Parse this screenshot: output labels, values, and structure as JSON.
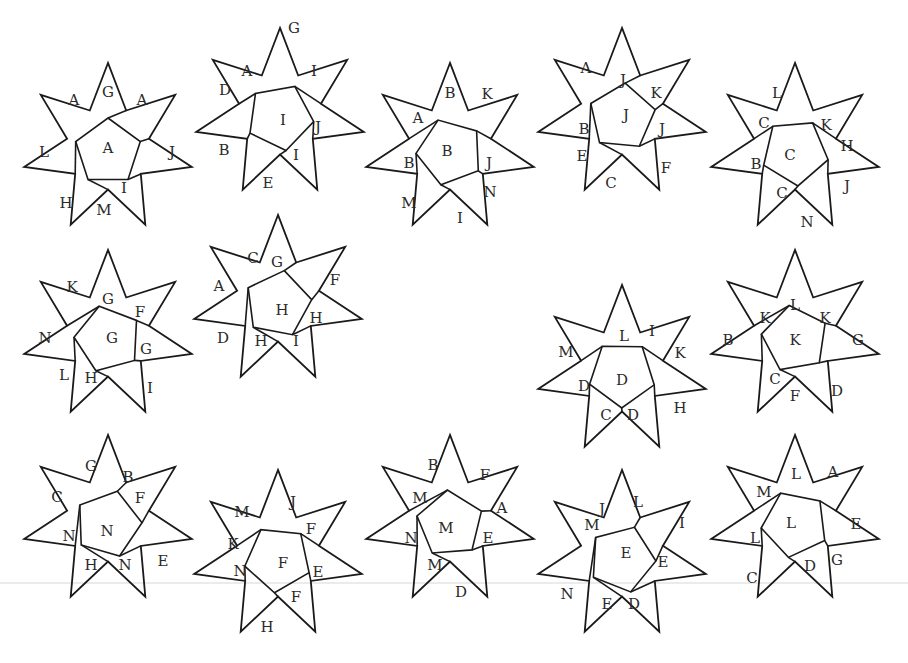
{
  "figure": {
    "stroke_color": "#1a1a1a",
    "label_color": "#2a2a2a",
    "faint_line_color": "#d8d8d8",
    "faint_line_y": 583,
    "outer_radius": 86,
    "inner_radius": 42
  },
  "stars": [
    {
      "id": 1,
      "center_label": "A",
      "cx": 108,
      "cy": 148,
      "labels": [
        {
          "t": "G",
          "dx": 0,
          "dy": -56
        },
        {
          "t": "A",
          "dx": -34,
          "dy": -48
        },
        {
          "t": "A",
          "dx": 34,
          "dy": -48
        },
        {
          "t": "L",
          "dx": -64,
          "dy": 4
        },
        {
          "t": "J",
          "dx": 64,
          "dy": 4
        },
        {
          "t": "A",
          "dx": 0,
          "dy": 0
        },
        {
          "t": "I",
          "dx": 16,
          "dy": 40
        },
        {
          "t": "H",
          "dx": -42,
          "dy": 55
        },
        {
          "t": "M",
          "dx": -4,
          "dy": 62
        }
      ]
    },
    {
      "id": 2,
      "center_label": "I",
      "cx": 280,
      "cy": 113,
      "labels": [
        {
          "t": "G",
          "dx": 14,
          "dy": -85
        },
        {
          "t": "A",
          "dx": -33,
          "dy": -42
        },
        {
          "t": "I",
          "dx": 34,
          "dy": -42
        },
        {
          "t": "D",
          "dx": -55,
          "dy": -23
        },
        {
          "t": "I",
          "dx": 3,
          "dy": 7
        },
        {
          "t": "J",
          "dx": 38,
          "dy": 14
        },
        {
          "t": "B",
          "dx": -56,
          "dy": 37
        },
        {
          "t": "I",
          "dx": 16,
          "dy": 42
        },
        {
          "t": "E",
          "dx": -12,
          "dy": 70
        }
      ]
    },
    {
      "id": 3,
      "center_label": "B",
      "cx": 450,
      "cy": 148,
      "labels": [
        {
          "t": "B",
          "dx": 0,
          "dy": -55
        },
        {
          "t": "K",
          "dx": 37,
          "dy": -54
        },
        {
          "t": "A",
          "dx": -32,
          "dy": -30
        },
        {
          "t": "B",
          "dx": -3,
          "dy": 3
        },
        {
          "t": "B",
          "dx": -41,
          "dy": 15
        },
        {
          "t": "J",
          "dx": 39,
          "dy": 15
        },
        {
          "t": "N",
          "dx": 40,
          "dy": 44
        },
        {
          "t": "M",
          "dx": -41,
          "dy": 55
        },
        {
          "t": "I",
          "dx": 10,
          "dy": 70
        }
      ]
    },
    {
      "id": 4,
      "center_label": "J",
      "cx": 622,
      "cy": 113,
      "labels": [
        {
          "t": "A",
          "dx": -36,
          "dy": -45
        },
        {
          "t": "J",
          "dx": 1,
          "dy": -33
        },
        {
          "t": "K",
          "dx": 34,
          "dy": -20
        },
        {
          "t": "J",
          "dx": 4,
          "dy": 2
        },
        {
          "t": "B",
          "dx": -38,
          "dy": 16
        },
        {
          "t": "J",
          "dx": 40,
          "dy": 16
        },
        {
          "t": "E",
          "dx": -40,
          "dy": 43
        },
        {
          "t": "F",
          "dx": 44,
          "dy": 55
        },
        {
          "t": "C",
          "dx": -11,
          "dy": 70
        }
      ]
    },
    {
      "id": 5,
      "center_label": "C",
      "cx": 795,
      "cy": 148,
      "labels": [
        {
          "t": "L",
          "dx": -18,
          "dy": -55
        },
        {
          "t": "C",
          "dx": -31,
          "dy": -25
        },
        {
          "t": "K",
          "dx": 31,
          "dy": -23
        },
        {
          "t": "H",
          "dx": 52,
          "dy": -2
        },
        {
          "t": "C",
          "dx": -5,
          "dy": 7
        },
        {
          "t": "B",
          "dx": -39,
          "dy": 16
        },
        {
          "t": "J",
          "dx": 52,
          "dy": 38
        },
        {
          "t": "C",
          "dx": -13,
          "dy": 45
        },
        {
          "t": "N",
          "dx": 12,
          "dy": 74
        }
      ]
    },
    {
      "id": 6,
      "center_label": "G",
      "cx": 108,
      "cy": 335,
      "labels": [
        {
          "t": "K",
          "dx": -36,
          "dy": -48
        },
        {
          "t": "G",
          "dx": 0,
          "dy": -36
        },
        {
          "t": "F",
          "dx": 32,
          "dy": -23
        },
        {
          "t": "N",
          "dx": -63,
          "dy": 3
        },
        {
          "t": "G",
          "dx": 4,
          "dy": 3
        },
        {
          "t": "G",
          "dx": 38,
          "dy": 14
        },
        {
          "t": "L",
          "dx": -44,
          "dy": 40
        },
        {
          "t": "H",
          "dx": -17,
          "dy": 43
        },
        {
          "t": "I",
          "dx": 42,
          "dy": 53
        }
      ]
    },
    {
      "id": 7,
      "center_label": "H",
      "cx": 278,
      "cy": 300,
      "labels": [
        {
          "t": "C",
          "dx": -25,
          "dy": -42
        },
        {
          "t": "G",
          "dx": -1,
          "dy": -38
        },
        {
          "t": "F",
          "dx": 57,
          "dy": -20
        },
        {
          "t": "A",
          "dx": -59,
          "dy": -14
        },
        {
          "t": "H",
          "dx": 4,
          "dy": 10
        },
        {
          "t": "H",
          "dx": 38,
          "dy": 18
        },
        {
          "t": "D",
          "dx": -55,
          "dy": 38
        },
        {
          "t": "H",
          "dx": -17,
          "dy": 41
        },
        {
          "t": "I",
          "dx": 18,
          "dy": 41
        }
      ]
    },
    {
      "id": 8,
      "center_label": "D",
      "cx": 622,
      "cy": 370,
      "labels": [
        {
          "t": "L",
          "dx": 2,
          "dy": -34
        },
        {
          "t": "I",
          "dx": 30,
          "dy": -39
        },
        {
          "t": "M",
          "dx": -56,
          "dy": -18
        },
        {
          "t": "K",
          "dx": 58,
          "dy": -17
        },
        {
          "t": "D",
          "dx": 0,
          "dy": 10
        },
        {
          "t": "D",
          "dx": -38,
          "dy": 16
        },
        {
          "t": "C",
          "dx": -16,
          "dy": 45
        },
        {
          "t": "D",
          "dx": 11,
          "dy": 45
        },
        {
          "t": "H",
          "dx": 58,
          "dy": 38
        }
      ]
    },
    {
      "id": 9,
      "center_label": "K",
      "cx": 795,
      "cy": 335,
      "labels": [
        {
          "t": "L",
          "dx": 0,
          "dy": -30
        },
        {
          "t": "K",
          "dx": -30,
          "dy": -17
        },
        {
          "t": "K",
          "dx": 30,
          "dy": -17
        },
        {
          "t": "B",
          "dx": -67,
          "dy": 5
        },
        {
          "t": "K",
          "dx": 0,
          "dy": 5
        },
        {
          "t": "G",
          "dx": 63,
          "dy": 5
        },
        {
          "t": "C",
          "dx": -20,
          "dy": 44
        },
        {
          "t": "F",
          "dx": 0,
          "dy": 61
        },
        {
          "t": "D",
          "dx": 42,
          "dy": 56
        }
      ]
    },
    {
      "id": 10,
      "center_label": "N",
      "cx": 108,
      "cy": 520,
      "labels": [
        {
          "t": "G",
          "dx": -17,
          "dy": -54
        },
        {
          "t": "B",
          "dx": 20,
          "dy": -43
        },
        {
          "t": "C",
          "dx": -51,
          "dy": -23
        },
        {
          "t": "F",
          "dx": 32,
          "dy": -22
        },
        {
          "t": "N",
          "dx": -1,
          "dy": 11
        },
        {
          "t": "N",
          "dx": -39,
          "dy": 16
        },
        {
          "t": "H",
          "dx": -17,
          "dy": 45
        },
        {
          "t": "N",
          "dx": 17,
          "dy": 45
        },
        {
          "t": "E",
          "dx": 55,
          "dy": 41
        }
      ]
    },
    {
      "id": 11,
      "center_label": "F",
      "cx": 278,
      "cy": 555,
      "labels": [
        {
          "t": "J",
          "dx": 15,
          "dy": -53
        },
        {
          "t": "M",
          "dx": -36,
          "dy": -43
        },
        {
          "t": "F",
          "dx": 33,
          "dy": -26
        },
        {
          "t": "K",
          "dx": -45,
          "dy": -11
        },
        {
          "t": "F",
          "dx": 5,
          "dy": 8
        },
        {
          "t": "N",
          "dx": -38,
          "dy": 16
        },
        {
          "t": "E",
          "dx": 40,
          "dy": 17
        },
        {
          "t": "F",
          "dx": 18,
          "dy": 42
        },
        {
          "t": "H",
          "dx": -11,
          "dy": 72
        }
      ]
    },
    {
      "id": 12,
      "center_label": "M",
      "cx": 450,
      "cy": 520,
      "labels": [
        {
          "t": "B",
          "dx": -17,
          "dy": -55
        },
        {
          "t": "F",
          "dx": 35,
          "dy": -45
        },
        {
          "t": "M",
          "dx": -30,
          "dy": -22
        },
        {
          "t": "A",
          "dx": 52,
          "dy": -12
        },
        {
          "t": "M",
          "dx": -4,
          "dy": 8
        },
        {
          "t": "N",
          "dx": -39,
          "dy": 18
        },
        {
          "t": "E",
          "dx": 38,
          "dy": 18
        },
        {
          "t": "M",
          "dx": -15,
          "dy": 45
        },
        {
          "t": "D",
          "dx": 11,
          "dy": 72
        }
      ]
    },
    {
      "id": 13,
      "center_label": "E",
      "cx": 622,
      "cy": 555,
      "labels": [
        {
          "t": "L",
          "dx": 16,
          "dy": -53
        },
        {
          "t": "J",
          "dx": -20,
          "dy": -46
        },
        {
          "t": "I",
          "dx": 60,
          "dy": -32
        },
        {
          "t": "M",
          "dx": -30,
          "dy": -30
        },
        {
          "t": "E",
          "dx": 4,
          "dy": -2
        },
        {
          "t": "E",
          "dx": 41,
          "dy": 7
        },
        {
          "t": "N",
          "dx": -55,
          "dy": 39
        },
        {
          "t": "E",
          "dx": -15,
          "dy": 49
        },
        {
          "t": "D",
          "dx": 12,
          "dy": 49
        }
      ]
    },
    {
      "id": 14,
      "center_label": "L",
      "cx": 795,
      "cy": 520,
      "labels": [
        {
          "t": "L",
          "dx": 1,
          "dy": -46
        },
        {
          "t": "A",
          "dx": 38,
          "dy": -48
        },
        {
          "t": "M",
          "dx": -31,
          "dy": -28
        },
        {
          "t": "E",
          "dx": 61,
          "dy": 4
        },
        {
          "t": "L",
          "dx": -4,
          "dy": 3
        },
        {
          "t": "L",
          "dx": -40,
          "dy": 18
        },
        {
          "t": "G",
          "dx": 42,
          "dy": 40
        },
        {
          "t": "D",
          "dx": 15,
          "dy": 46
        },
        {
          "t": "C",
          "dx": -43,
          "dy": 58
        }
      ]
    }
  ]
}
